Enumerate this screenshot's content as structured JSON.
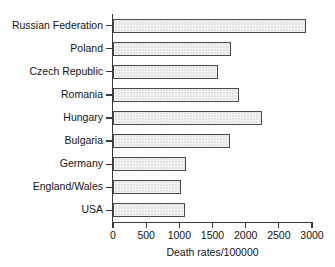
{
  "chart_data": {
    "type": "bar",
    "orientation": "horizontal",
    "title": "",
    "xlabel": "Death rates/100000",
    "ylabel": "",
    "categories": [
      "Russian Federation",
      "Poland",
      "Czech Republic",
      "Romania",
      "Hungary",
      "Bulgaria",
      "Germany",
      "England/Wales",
      "USA"
    ],
    "values": [
      2910,
      1780,
      1580,
      1900,
      2245,
      1765,
      1100,
      1025,
      1085
    ],
    "xlim": [
      0,
      3000
    ],
    "xticks": [
      0,
      500,
      1000,
      1500,
      2000,
      2500,
      3000
    ],
    "xtick_labels": [
      "0",
      "500",
      "1000",
      "1500",
      "2000",
      "2500",
      "3000"
    ],
    "grid": false,
    "legend": null,
    "bar_fill_color": "#e3e3e3",
    "bar_edge_color": "#4a4a4a",
    "axis_color": "#3a3a3a",
    "background_color": "#ffffff"
  }
}
